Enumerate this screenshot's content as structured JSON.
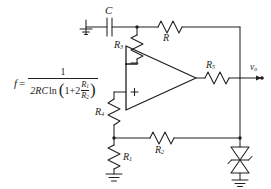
{
  "diagram": {
    "type": "circuit-schematic",
    "line_color": "#231f20",
    "background_color": "#ffffff"
  },
  "formula": {
    "lhs": "f",
    "equals": "=",
    "numerator": "1",
    "denominator_prefix": "2RC",
    "ln": "ln",
    "paren_open": "(",
    "one": "1",
    "plus_two": "+2",
    "frac_numerator": "R",
    "frac_numerator_sub": "1",
    "frac_denominator": "R",
    "frac_denominator_sub": "2",
    "paren_close": ")",
    "plain_text": "f = 1 / (2RC ln(1 + 2 R1/R2))"
  },
  "components": {
    "capacitor": {
      "label": "C",
      "sub": ""
    },
    "resistor_r": {
      "label": "R",
      "sub": ""
    },
    "resistor_r1": {
      "label": "R",
      "sub": "1"
    },
    "resistor_r2": {
      "label": "R",
      "sub": "2"
    },
    "resistor_r3": {
      "label": "R",
      "sub": "3"
    },
    "resistor_r4": {
      "label": "R",
      "sub": "4"
    },
    "resistor_r5": {
      "label": "R",
      "sub": "5"
    },
    "opamp": {
      "inverting": "–",
      "noninverting": "+"
    },
    "output_node": {
      "label": "v",
      "sub": "o"
    },
    "zener_pair": {
      "label": ""
    },
    "grounds": [
      "ground-capacitor",
      "ground-r1",
      "ground-zener"
    ]
  }
}
